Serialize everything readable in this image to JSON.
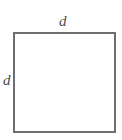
{
  "figure": {
    "name": "square-diagram",
    "shape": "square",
    "background_color": "#ffffff",
    "stroke_color": "#6e6e6e",
    "stroke_width_px": 2,
    "label_color": "#4a4a4a",
    "labels": {
      "top": "d",
      "left": "d"
    }
  }
}
